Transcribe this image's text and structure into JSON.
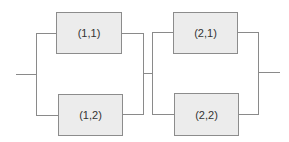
{
  "diagram": {
    "type": "series-parallel reliability block diagram",
    "stages": [
      {
        "id": 1,
        "components": [
          {
            "label": "(1,1)"
          },
          {
            "label": "(1,2)"
          }
        ]
      },
      {
        "id": 2,
        "components": [
          {
            "label": "(2,1)"
          },
          {
            "label": "(2,2)"
          }
        ]
      }
    ],
    "colors": {
      "box_fill": "#ececec",
      "box_border": "#8c8c8c",
      "line": "#8a8a8a",
      "text": "#333333"
    }
  }
}
